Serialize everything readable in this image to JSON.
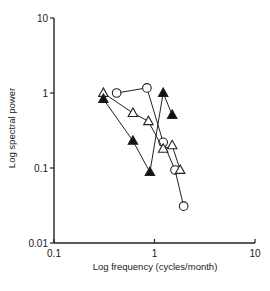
{
  "chart_data": {
    "type": "line",
    "title": "",
    "xlabel": "Log frequency (cycles/month)",
    "ylabel": "Log spectral power",
    "xscale": "log",
    "yscale": "log",
    "xlim": [
      0.1,
      10
    ],
    "ylim": [
      0.01,
      10
    ],
    "x_ticks": [
      "0.1",
      "1",
      "10"
    ],
    "y_ticks": [
      "0.01",
      "0.1",
      "1",
      "10"
    ],
    "grid": false,
    "legend": null,
    "series": [
      {
        "name": "open-circles",
        "marker": "circle-open",
        "points": [
          [
            0.42,
            1.0
          ],
          [
            0.84,
            1.17
          ],
          [
            1.22,
            0.22
          ],
          [
            1.6,
            0.094
          ],
          [
            1.95,
            0.031
          ]
        ]
      },
      {
        "name": "open-triangles",
        "marker": "triangle-open",
        "points": [
          [
            0.31,
            1.0
          ],
          [
            0.61,
            0.54
          ],
          [
            0.87,
            0.42
          ],
          [
            1.22,
            0.18
          ],
          [
            1.5,
            0.2
          ],
          [
            1.8,
            0.094
          ]
        ]
      },
      {
        "name": "filled-triangles",
        "marker": "triangle-filled",
        "points": [
          [
            0.31,
            0.83
          ],
          [
            0.61,
            0.23
          ],
          [
            0.9,
            0.088
          ],
          [
            1.22,
            1.0
          ],
          [
            1.5,
            0.51
          ]
        ]
      }
    ]
  },
  "axes": {
    "xlabel": "Log frequency (cycles/month)",
    "ylabel": "Log spectral power",
    "x_ticks": [
      "0.1",
      "1",
      "10"
    ],
    "y_ticks": [
      "0.01",
      "0.1",
      "1",
      "10"
    ]
  }
}
